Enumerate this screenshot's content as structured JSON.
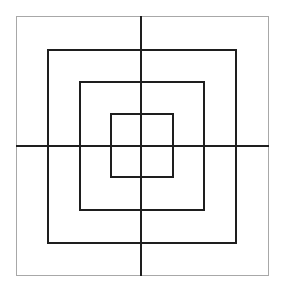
{
  "diagram": {
    "colors": {
      "outer_border": "#a8a8a8",
      "inner_borders": "#1e1e1e",
      "lines": "#1e1e1e",
      "background": "#ffffff"
    },
    "squares": [
      {
        "name": "outer",
        "x": 16,
        "y": 16,
        "w": 253,
        "h": 260
      },
      {
        "name": "second",
        "x": 47,
        "y": 49,
        "w": 190,
        "h": 195
      },
      {
        "name": "third",
        "x": 79,
        "y": 81,
        "w": 126,
        "h": 130
      },
      {
        "name": "inner",
        "x": 110,
        "y": 113,
        "w": 64,
        "h": 65
      }
    ],
    "vertical_line_x": 141,
    "horizontal_line_y": 146
  }
}
